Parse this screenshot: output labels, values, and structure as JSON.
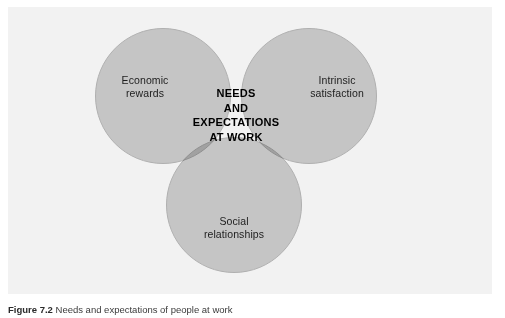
{
  "figure": {
    "caption_number": "Figure 7.2",
    "caption_text": "Needs and expectations of people at work",
    "panel_background": "#f2f2f2",
    "page_background": "#ffffff"
  },
  "diagram": {
    "type": "venn",
    "circle_fill": "#b3b3b3",
    "circle_stroke": "#8e8e8e",
    "center_label": "NEEDS\nAND\nEXPECTATIONS\nAT WORK",
    "circles": [
      {
        "id": "economic",
        "label": "Economic\nrewards",
        "position": "left"
      },
      {
        "id": "intrinsic",
        "label": "Intrinsic\nsatisfaction",
        "position": "right"
      },
      {
        "id": "social",
        "label": "Social\nrelationships",
        "position": "bottom"
      }
    ]
  }
}
